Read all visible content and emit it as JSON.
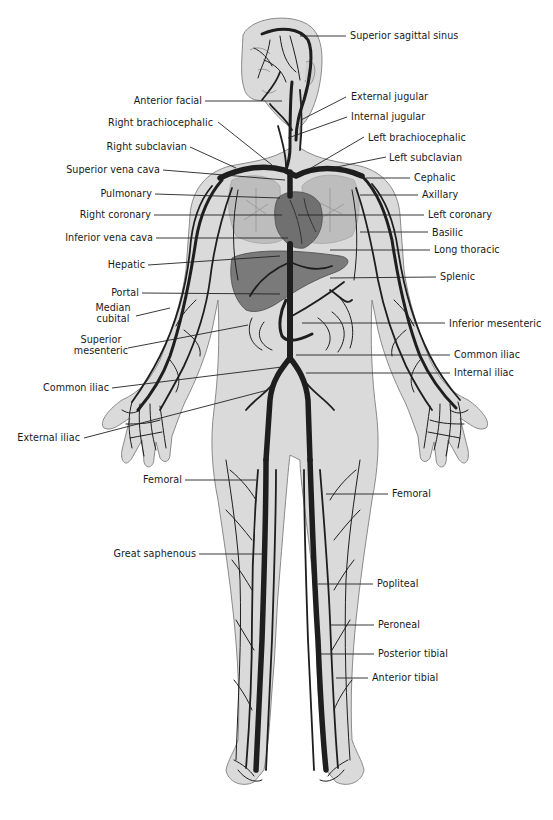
{
  "figure": {
    "colors": {
      "background": "#ffffff",
      "skin": "#d9d9d9",
      "skin_outline": "#8a8a8a",
      "vein": "#1e1e1e",
      "organ": "#6e6e6e",
      "leader_line": "#222222",
      "label_text": "#1a1a1a"
    }
  },
  "labels": {
    "superior_sagittal_sinus": "Superior sagittal sinus",
    "anterior_facial": "Anterior facial",
    "external_jugular": "External jugular",
    "internal_jugular": "Internal jugular",
    "right_brachiocephalic": "Right brachiocephalic",
    "left_brachiocephalic": "Left brachiocephalic",
    "right_subclavian": "Right subclavian",
    "left_subclavian": "Left subclavian",
    "superior_vena_cava": "Superior vena cava",
    "cephalic": "Cephalic",
    "pulmonary": "Pulmonary",
    "axillary": "Axillary",
    "right_coronary": "Right coronary",
    "left_coronary": "Left coronary",
    "inferior_vena_cava": "Inferior vena cava",
    "basilic": "Basilic",
    "long_thoracic": "Long thoracic",
    "hepatic": "Hepatic",
    "splenic": "Splenic",
    "portal": "Portal",
    "median_cubital": "Median cubital",
    "inferior_mesenteric": "Inferior mesenteric",
    "superior_mesenteric": "Superior mesenteric",
    "common_iliac_right": "Common iliac",
    "common_iliac_left": "Common iliac",
    "internal_iliac": "Internal iliac",
    "external_iliac": "External iliac",
    "femoral_left_side": "Femoral",
    "femoral_right_side": "Femoral",
    "great_saphenous": "Great saphenous",
    "popliteal": "Popliteal",
    "peroneal": "Peroneal",
    "posterior_tibial": "Posterior tibial",
    "anterior_tibial": "Anterior tibial"
  }
}
